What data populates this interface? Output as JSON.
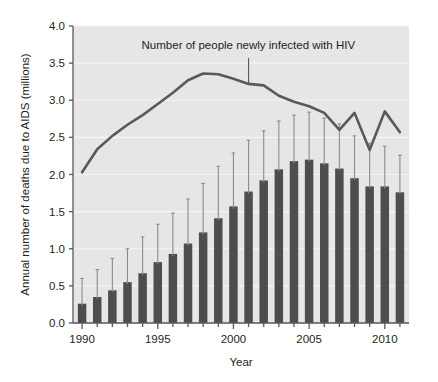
{
  "chart_data": {
    "type": "bar",
    "title": "",
    "xlabel": "Year",
    "ylabel": "Annual number of deaths due to AIDS (millions)",
    "xlim": [
      1989.4,
      2011.6
    ],
    "ylim": [
      0.0,
      4.0
    ],
    "grid": true,
    "legend_position": "none",
    "categories": [
      1990,
      1991,
      1992,
      1993,
      1994,
      1995,
      1996,
      1997,
      1998,
      1999,
      2000,
      2001,
      2002,
      2003,
      2004,
      2005,
      2006,
      2007,
      2008,
      2009,
      2010,
      2011
    ],
    "xtick_labels": [
      "1990",
      "1995",
      "2000",
      "2005",
      "2010"
    ],
    "xticks": [
      1990,
      1995,
      2000,
      2005,
      2010
    ],
    "yticks": [
      0.0,
      0.5,
      1.0,
      1.5,
      2.0,
      2.5,
      3.0,
      3.5,
      4.0
    ],
    "ytick_labels": [
      "0.0",
      "0.5",
      "1.0",
      "1.5",
      "2.0",
      "2.5",
      "3.0",
      "3.5",
      "4.0"
    ],
    "series": [
      {
        "name": "Annual number of deaths due to AIDS (millions)",
        "type": "bar",
        "color": "#4d4d4d",
        "values": [
          0.26,
          0.35,
          0.44,
          0.55,
          0.67,
          0.82,
          0.93,
          1.07,
          1.22,
          1.41,
          1.57,
          1.77,
          1.92,
          2.07,
          2.18,
          2.2,
          2.15,
          2.08,
          1.95,
          1.84,
          1.84,
          1.76
        ],
        "error_upper": [
          0.6,
          0.72,
          0.87,
          1.0,
          1.16,
          1.33,
          1.48,
          1.67,
          1.88,
          2.11,
          2.29,
          2.46,
          2.59,
          2.72,
          2.8,
          2.84,
          2.76,
          2.68,
          2.52,
          2.42,
          2.38,
          2.26
        ],
        "error_style": "upper-cap-only"
      },
      {
        "name": "Number of people newly infected with HIV",
        "type": "line",
        "color": "#595959",
        "x": [
          1990,
          1991,
          1992,
          1993,
          1994,
          1995,
          1996,
          1997,
          1998,
          1999,
          2000,
          2001,
          2002,
          2003,
          2004,
          2005,
          2006,
          2007,
          2008,
          2009,
          2010,
          2011
        ],
        "values": [
          2.03,
          2.34,
          2.52,
          2.67,
          2.8,
          2.95,
          3.1,
          3.27,
          3.36,
          3.35,
          3.29,
          3.22,
          3.2,
          3.06,
          2.98,
          2.92,
          2.83,
          2.6,
          2.83,
          2.33,
          2.85,
          2.57
        ]
      }
    ],
    "annotations": [
      {
        "text": "Number of people newly infected with HIV",
        "points_to_year": 2001,
        "points_to_value": 3.22
      }
    ]
  },
  "axes": {
    "y_title": "Annual number of deaths due to AIDS (millions)",
    "x_title": "Year"
  },
  "style": {
    "plot_background": "#e6e6e6",
    "grid_color": "#f5f5f5",
    "axis_color": "#58595b",
    "bar_color": "#4d4d4d",
    "line_color": "#595959",
    "error_bar_color": "#8c8c8c",
    "text_color": "#231f20"
  }
}
